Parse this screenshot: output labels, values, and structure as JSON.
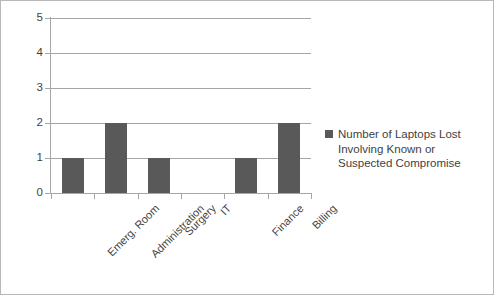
{
  "chart_data": {
    "type": "bar",
    "title": "",
    "subtitle": "",
    "xlabel": "",
    "ylabel": "",
    "categories": [
      "Emerg. Room",
      "Administration",
      "Surgery",
      "IT",
      "Finance",
      "Billing"
    ],
    "values": [
      1,
      2,
      1,
      0,
      1,
      2
    ],
    "series": [
      {
        "name": "Number of Laptops Lost Involving Known or Suspected Compromise",
        "values": [
          1,
          2,
          1,
          0,
          1,
          2
        ],
        "color": "#595959"
      }
    ],
    "ylim": [
      0,
      5
    ],
    "ytick_labels": [
      "0",
      "1",
      "2",
      "3",
      "4",
      "5"
    ],
    "ytick_values": [
      0,
      1,
      2,
      3,
      4,
      5
    ],
    "grid": true,
    "grid_axis": "y",
    "legend_position": "right",
    "legend": [
      {
        "label_lines": [
          "Number of Laptops Lost",
          "Involving Known or",
          "Suspected Compromise"
        ],
        "label": "Number of Laptops Lost Involving Known or Suspected Compromise",
        "color": "#595959"
      }
    ],
    "category_label_rotation": -45,
    "background_color": "#ffffff",
    "axis_color": "#a6a6a6",
    "text_color": "#3f3f3f",
    "border_color": "#b8b8b8"
  }
}
